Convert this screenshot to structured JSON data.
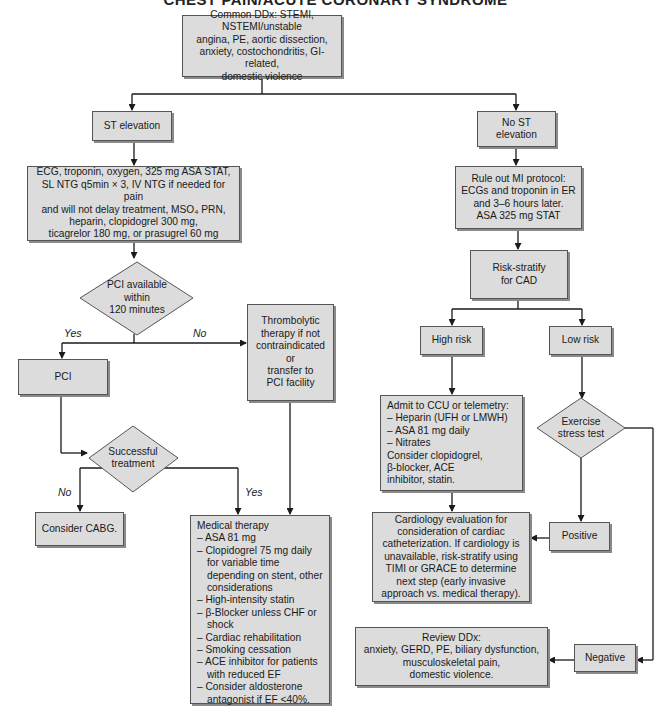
{
  "title": "CHEST PAIN/ACUTE CORONARY SYNDROME",
  "nodes": {
    "start": "Common DDx: STEMI, NSTEMI/unstable\nangina, PE, aortic dissection,\nanxiety, costochondritis, GI-related,\ndomestic violence",
    "st_elevation": "ST elevation",
    "st_workup": "ECG, troponin, oxygen, 325 mg ASA STAT,\nSL NTG q5min × 3, IV NTG if needed for pain\nand will not delay treatment, MSO₄ PRN,\nheparin, clopidogrel 300 mg,\nticagrelor 180 mg, or prasugrel 60 mg",
    "pci_decision": "PCI available\nwithin\n120 minutes",
    "thrombolytic": "Thrombolytic\ntherapy if not\ncontraindicated\nor\ntransfer to\nPCI facility",
    "pci": "PCI",
    "successful_decision": "Successful\ntreatment",
    "cabg": "Consider CABG.",
    "medical_therapy": {
      "heading": "Medical therapy",
      "items": [
        "– ASA 81 mg",
        "– Clopidogrel 75 mg daily for variable time depending on stent, other considerations",
        "– High-intensity statin",
        "– β-Blocker unless CHF or shock",
        "– Cardiac rehabilitation",
        "– Smoking cessation",
        "– ACE inhibitor for patients with reduced EF",
        "– Consider aldosterone antagonist if EF <40%."
      ]
    },
    "no_st_elevation": "No ST\nelevation",
    "rule_out_mi": "Rule out MI protocol:\nECGs and troponin in ER\nand 3–6 hours later.\nASA 325 mg STAT",
    "risk_stratify": "Risk-stratify\nfor CAD",
    "high_risk": "High risk",
    "low_risk": "Low risk",
    "admit": {
      "heading": "Admit to CCU or telemetry:",
      "items": [
        "– Heparin (UFH or LMWH)",
        "– ASA 81 mg daily",
        "– Nitrates"
      ],
      "footer": "Consider clopidogrel,\nβ-blocker, ACE\ninhibitor, statin."
    },
    "exercise_decision": "Exercise\nstress test",
    "cardiology_eval": "Cardiology evaluation for\nconsideration of cardiac\ncatheterization. If cardiology is\nunavailable, risk-stratify using\nTIMI or GRACE to determine\nnext step (early invasive\napproach vs. medical therapy).",
    "positive": "Positive",
    "negative": "Negative",
    "review_ddx": "Review DDx:\nanxiety, GERD, PE, biliary dysfunction,\nmusculoskeletal pain,\ndomestic violence."
  },
  "edge_labels": {
    "pci_yes": "Yes",
    "pci_no": "No",
    "success_no": "No",
    "success_yes": "Yes"
  },
  "colors": {
    "box_fill": "#dcdcdc",
    "box_border": "#555555",
    "shadow": "#8a8a8a",
    "line": "#1a1a1a"
  }
}
